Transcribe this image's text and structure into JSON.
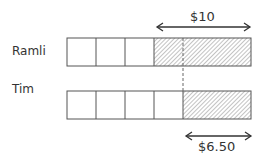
{
  "diagram": {
    "type": "bar-model",
    "rows": [
      {
        "name": "Ramli",
        "units": 3,
        "hatched_units": 3.33,
        "note": "3 plain units followed by hatched part"
      },
      {
        "name": "Tim",
        "units": 4,
        "hatched_units": 2.33,
        "note": "4 plain units followed by hatched part"
      }
    ],
    "top_brace_label": "$10",
    "bottom_brace_label": "$6.50",
    "colors": {
      "stroke": "#555555",
      "hatch": "#777777",
      "text": "#333333"
    }
  }
}
